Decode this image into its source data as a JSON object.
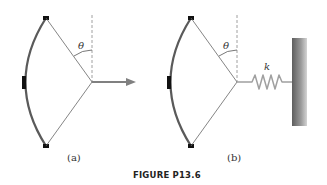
{
  "figure": {
    "caption": "FIGURE P13.6",
    "panels": [
      {
        "label": "(a)",
        "angle_symbol": "θ",
        "description": "Bow with string pulled by a horizontal force arrow"
      },
      {
        "label": "(b)",
        "angle_symbol": "θ",
        "spring_symbol": "k",
        "description": "Bow with string attached to a spring connected to a wall"
      }
    ]
  },
  "colors": {
    "bow": "#555555",
    "grip": "#111111",
    "string": "#666666",
    "dashed": "#888888",
    "arrow": "#808080",
    "spring": "#a0a0a0",
    "wall_dark": "#6a6a6a",
    "wall_light": "#c8c8c8"
  }
}
